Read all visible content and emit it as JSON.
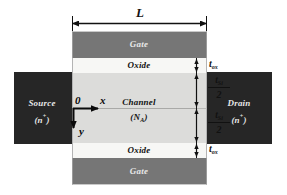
{
  "figure": {
    "colors": {
      "gate_fill": "#767676",
      "oxide_fill": "#f7f7f5",
      "channel_fill": "#dcdcda",
      "contact_fill": "#262626",
      "line": "#111111",
      "label_on_dark": "#e8e8e8",
      "label_on_light": "#121212",
      "background": "#ffffff"
    }
  },
  "dimensions": {
    "length": {
      "label": "L",
      "description": "channel length dimension arrow spanning device width"
    },
    "oxide_thickness_top": {
      "symbol": "t",
      "subscript": "ox",
      "label": "tox"
    },
    "oxide_thickness_bottom": {
      "symbol": "t",
      "subscript": "ox",
      "label": "tox"
    },
    "silicon_half_upper": {
      "numerator_symbol": "t",
      "numerator_subscript": "Si",
      "denominator": "2",
      "label": "tSi/2"
    },
    "silicon_half_lower": {
      "numerator_symbol": "t",
      "numerator_subscript": "Si",
      "denominator": "2",
      "label": "tSi/2"
    }
  },
  "layers": {
    "gate_top": {
      "label": "Gate"
    },
    "oxide_top": {
      "label": "Oxide"
    },
    "channel": {
      "label": "Channel",
      "doping_label": "(",
      "doping_symbol": "N",
      "doping_subscript": "A",
      "doping_close": ")"
    },
    "oxide_bottom": {
      "label": "Oxide"
    },
    "gate_bottom": {
      "label": "Gate"
    }
  },
  "terminals": {
    "source": {
      "label": "Source",
      "type_open": "(",
      "type_symbol": "n",
      "type_sup": "+",
      "type_close": ")"
    },
    "drain": {
      "label": "Drain",
      "type_open": "(",
      "type_symbol": "n",
      "type_sup": "+",
      "type_close": ")"
    }
  },
  "axes": {
    "origin": {
      "label": "0"
    },
    "x_axis": {
      "label": "x",
      "direction": "right"
    },
    "y_axis": {
      "label": "y",
      "direction": "down"
    }
  }
}
